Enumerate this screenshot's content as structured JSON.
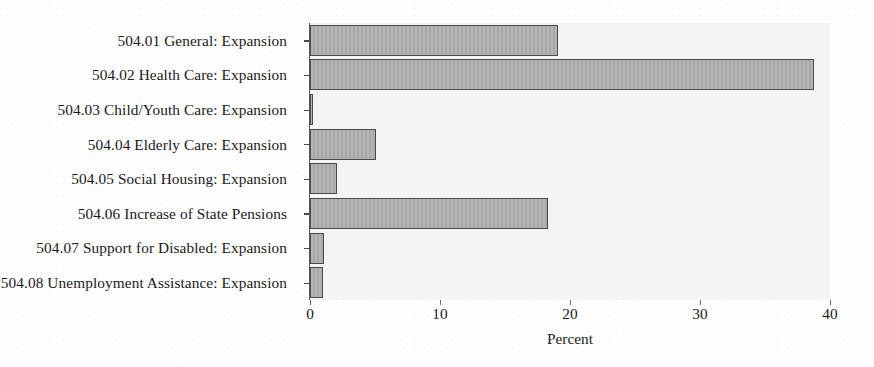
{
  "chart_data": {
    "type": "bar",
    "orientation": "horizontal",
    "title": "",
    "subtitle": "",
    "xlabel": "Percent",
    "ylabel": "",
    "xlim": [
      0,
      40
    ],
    "ylim": null,
    "grid": false,
    "legend": null,
    "xticks": [
      "0",
      "10",
      "20",
      "30",
      "40"
    ],
    "xtick_values": [
      0,
      10,
      20,
      30,
      40
    ],
    "categories": [
      "504.01 General: Expansion",
      "504.02 Health Care: Expansion",
      "504.03 Child/Youth Care: Expansion",
      "504.04 Elderly Care: Expansion",
      "504.05 Social Housing: Expansion",
      "504.06 Increase of State Pensions",
      "504.07 Support for Disabled: Expansion",
      "504.08 Unemployment Assistance: Expansion"
    ],
    "values": [
      19.1,
      38.8,
      0.2,
      5.1,
      2.1,
      18.3,
      1.1,
      1.0
    ],
    "series": [
      {
        "name": "Percent",
        "values": [
          19.1,
          38.8,
          0.2,
          5.1,
          2.1,
          18.3,
          1.1,
          1.0
        ]
      }
    ]
  },
  "style": {
    "bar_fill": "#adadad",
    "bar_edge": "#4a4a4a",
    "plot_background": "#f4f4f4",
    "page_background": "#fdfdfd",
    "text_color": "#1a1a1a"
  }
}
